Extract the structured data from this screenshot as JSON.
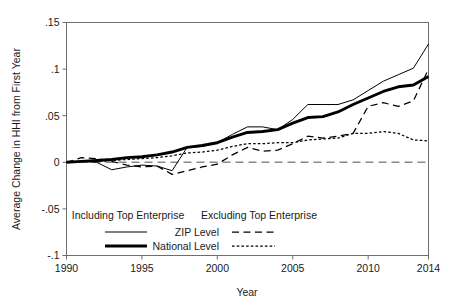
{
  "chart_data": {
    "type": "line",
    "title": "",
    "xlabel": "Year",
    "ylabel": "Average Change in HHI from First Year",
    "xlim": [
      1990,
      2014
    ],
    "ylim": [
      -0.1,
      0.15
    ],
    "xticks": [
      1990,
      1995,
      2000,
      2005,
      2010,
      2014
    ],
    "xtick_labels": [
      "1990",
      "1995",
      "2000",
      "2005",
      "2010",
      "2014"
    ],
    "yticks": [
      -0.1,
      -0.05,
      0,
      0.05,
      0.1,
      0.15
    ],
    "ytick_labels": [
      "-.1",
      "-.05",
      "0",
      ".05",
      ".1",
      ".15"
    ],
    "grid": false,
    "zero_reference_line": 0,
    "x": [
      1990,
      1991,
      1992,
      1993,
      1994,
      1995,
      1996,
      1997,
      1998,
      1999,
      2000,
      2001,
      2002,
      2003,
      2004,
      2005,
      2006,
      2007,
      2008,
      2009,
      2010,
      2011,
      2012,
      2013,
      2014
    ],
    "series": [
      {
        "name": "ZIP Level",
        "group": "Including Top Enterprise",
        "style": "thin-solid",
        "values": [
          0.0,
          0.001,
          0.0,
          -0.008,
          -0.005,
          -0.003,
          -0.004,
          -0.009,
          0.016,
          0.017,
          0.021,
          0.03,
          0.038,
          0.038,
          0.035,
          0.046,
          0.062,
          0.062,
          0.062,
          0.067,
          0.077,
          0.087,
          0.094,
          0.101,
          0.127
        ]
      },
      {
        "name": "National Level",
        "group": "Including Top Enterprise",
        "style": "thick-solid",
        "values": [
          0.0,
          0.001,
          0.002,
          0.003,
          0.005,
          0.006,
          0.008,
          0.011,
          0.016,
          0.018,
          0.021,
          0.027,
          0.032,
          0.033,
          0.035,
          0.042,
          0.048,
          0.049,
          0.054,
          0.062,
          0.069,
          0.076,
          0.081,
          0.083,
          0.092
        ]
      },
      {
        "name": "ZIP Level",
        "group": "Excluding Top Enterprise",
        "style": "dashed",
        "values": [
          0.0,
          0.005,
          0.004,
          0.001,
          -0.003,
          -0.005,
          -0.004,
          -0.013,
          -0.009,
          -0.005,
          -0.002,
          0.008,
          0.016,
          0.012,
          0.013,
          0.02,
          0.028,
          0.026,
          0.028,
          0.031,
          0.06,
          0.064,
          0.06,
          0.066,
          0.1
        ]
      },
      {
        "name": "National Level",
        "group": "Excluding Top Enterprise",
        "style": "dotted",
        "values": [
          0.0,
          0.001,
          0.001,
          0.002,
          0.003,
          0.004,
          0.005,
          0.007,
          0.01,
          0.011,
          0.013,
          0.017,
          0.02,
          0.02,
          0.021,
          0.021,
          0.024,
          0.025,
          0.026,
          0.031,
          0.031,
          0.033,
          0.031,
          0.024,
          0.023
        ]
      }
    ],
    "legend": {
      "position": "inside-bottom-left",
      "col_headers": [
        "Including Top Enterprise",
        "Excluding Top Enterprise"
      ],
      "rows": [
        {
          "label": "ZIP Level",
          "including_style": "thin-solid",
          "excluding_style": "dashed"
        },
        {
          "label": "National Level",
          "including_style": "thick-solid",
          "excluding_style": "dotted"
        }
      ]
    },
    "colors": {
      "line": "#000000",
      "frame": "#6e6e6e",
      "zero_line": "#8a8a8a",
      "text": "#1a1a1a",
      "background": "#ffffff"
    }
  }
}
